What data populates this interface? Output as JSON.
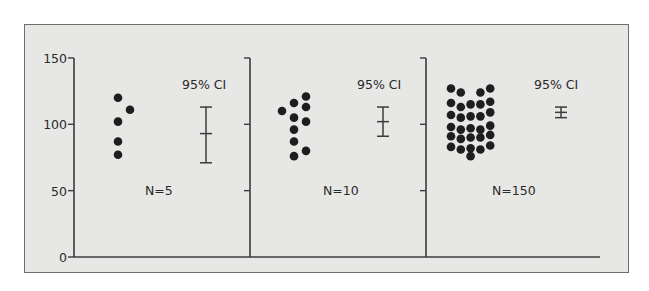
{
  "chart_data": {
    "type": "scatter",
    "title": "",
    "xlabel": "",
    "ylabel": "",
    "ylim": [
      0,
      150
    ],
    "yticks": [
      0,
      50,
      100,
      150
    ],
    "grid": false,
    "legend": null,
    "panels": [
      {
        "label": "N=5",
        "ci_label": "95% CI",
        "points": [
          {
            "col": 0,
            "y": 120
          },
          {
            "col": 1,
            "y": 111
          },
          {
            "col": 0,
            "y": 102
          },
          {
            "col": 0,
            "y": 87
          },
          {
            "col": 0,
            "y": 77
          }
        ],
        "ci": {
          "upper": 113,
          "mean": 93,
          "lower": 71
        }
      },
      {
        "label": "N=10",
        "ci_label": "95% CI",
        "points": [
          {
            "col": 0,
            "y": 110
          },
          {
            "col": 1,
            "y": 116
          },
          {
            "col": 2,
            "y": 121
          },
          {
            "col": 2,
            "y": 113
          },
          {
            "col": 1,
            "y": 105
          },
          {
            "col": 2,
            "y": 102
          },
          {
            "col": 1,
            "y": 96
          },
          {
            "col": 1,
            "y": 87
          },
          {
            "col": 2,
            "y": 80
          },
          {
            "col": 1,
            "y": 76
          }
        ],
        "ci": {
          "upper": 113,
          "mean": 102,
          "lower": 91
        }
      },
      {
        "label": "N=150",
        "ci_label": "95% CI",
        "points": [
          {
            "col": 0,
            "y": 127
          },
          {
            "col": 1,
            "y": 124
          },
          {
            "col": 3,
            "y": 124
          },
          {
            "col": 4,
            "y": 127
          },
          {
            "col": 0,
            "y": 116
          },
          {
            "col": 1,
            "y": 113
          },
          {
            "col": 2,
            "y": 115
          },
          {
            "col": 3,
            "y": 115
          },
          {
            "col": 4,
            "y": 117
          },
          {
            "col": 0,
            "y": 107
          },
          {
            "col": 1,
            "y": 105
          },
          {
            "col": 2,
            "y": 106
          },
          {
            "col": 3,
            "y": 106
          },
          {
            "col": 4,
            "y": 109
          },
          {
            "col": 0,
            "y": 98
          },
          {
            "col": 1,
            "y": 96
          },
          {
            "col": 2,
            "y": 97
          },
          {
            "col": 3,
            "y": 96
          },
          {
            "col": 4,
            "y": 99
          },
          {
            "col": 0,
            "y": 91
          },
          {
            "col": 1,
            "y": 89
          },
          {
            "col": 2,
            "y": 90
          },
          {
            "col": 3,
            "y": 90
          },
          {
            "col": 4,
            "y": 92
          },
          {
            "col": 0,
            "y": 83
          },
          {
            "col": 1,
            "y": 81
          },
          {
            "col": 2,
            "y": 82
          },
          {
            "col": 3,
            "y": 81
          },
          {
            "col": 4,
            "y": 84
          },
          {
            "col": 2,
            "y": 76
          }
        ],
        "ci": {
          "upper": 113,
          "mean": 109,
          "lower": 105
        }
      }
    ]
  },
  "layout": {
    "y_zero_px": 257,
    "px_per_unit": 1.327,
    "axis_top_px": 58,
    "x_axis_end_px": 600,
    "panel_axis_x": [
      74,
      250,
      426
    ],
    "panel_dot_x0": [
      118,
      282,
      451
    ],
    "panel_dot_dx": [
      12,
      12,
      9.8
    ],
    "panel_ci_x": [
      206,
      383,
      561
    ],
    "panel_ci_label_x": [
      182,
      357,
      534
    ],
    "panel_n_label_x": [
      145,
      323,
      492
    ],
    "ci_label_y": 89,
    "n_label_y": 195,
    "colors": {
      "ink": "#2a2a2a",
      "axis": "#3c3c3c",
      "frame_fill": "#e7e7e5",
      "frame_border": "#6e6e6e"
    }
  }
}
